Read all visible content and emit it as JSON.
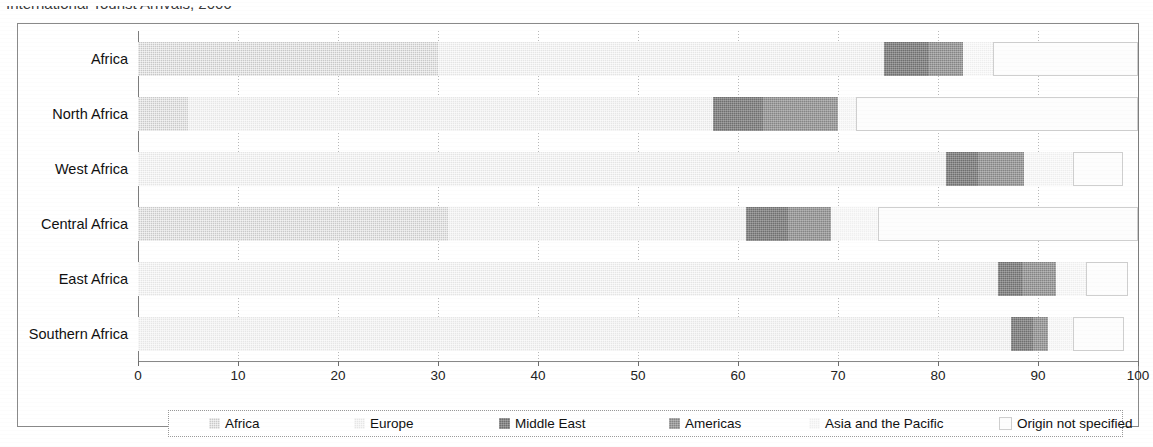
{
  "title": "International Tourist Arrivals, 2006",
  "title_right_mark": "",
  "axis": {
    "ticks": [
      0,
      10,
      20,
      30,
      40,
      50,
      60,
      70,
      80,
      90,
      100
    ],
    "min": 0,
    "max": 100
  },
  "legend": {
    "items": [
      {
        "label": "Africa",
        "swatch": "swatch-africa"
      },
      {
        "label": "Europe",
        "swatch": "swatch-europe"
      },
      {
        "label": "Middle East",
        "swatch": "swatch-middle-east"
      },
      {
        "label": "Americas",
        "swatch": "swatch-americas"
      },
      {
        "label": "Asia and the Pacific",
        "swatch": "swatch-asia-pacific"
      },
      {
        "label": "Origin not specified",
        "swatch": "swatch-origin-not-specified"
      }
    ]
  },
  "colors": {
    "africa": "#c9c9c9",
    "europe": "#e6e6e6",
    "middle_east": "#6f6f6f",
    "americas": "#858585",
    "asia_pacific": "#efefef",
    "origin_not_specified": "#fdfdfd",
    "frame": "#8a8a8a",
    "grid": "#b9b9b9"
  },
  "chart_data": {
    "type": "bar",
    "orientation": "horizontal",
    "stacked": true,
    "title": "International Tourist Arrivals, 2006",
    "xlabel": "",
    "ylabel": "",
    "xlim": [
      0,
      100
    ],
    "grid": true,
    "legend_position": "bottom",
    "categories": [
      "Africa",
      "North Africa",
      "West Africa",
      "Central Africa",
      "East Africa",
      "Southern Africa"
    ],
    "series": [
      {
        "name": "Africa",
        "values": [
          30.0,
          5.0,
          0.0,
          31.0,
          0.0,
          0.0
        ]
      },
      {
        "name": "Europe",
        "values": [
          44.6,
          52.5,
          80.8,
          29.8,
          86.0,
          87.3
        ]
      },
      {
        "name": "Middle East",
        "values": [
          4.5,
          5.0,
          3.2,
          4.2,
          2.5,
          2.2
        ]
      },
      {
        "name": "Americas",
        "values": [
          3.4,
          7.5,
          4.6,
          4.3,
          3.3,
          1.5
        ]
      },
      {
        "name": "Asia and the Pacific",
        "values": [
          3.0,
          1.8,
          4.9,
          4.7,
          3.0,
          2.5
        ]
      },
      {
        "name": "Origin not specified",
        "values": [
          14.5,
          28.2,
          5.0,
          26.0,
          4.2,
          5.1
        ]
      }
    ]
  },
  "bars": [
    {
      "category": "Africa",
      "segments": [
        {
          "series": "Africa",
          "start": 0.0,
          "end": 30.0,
          "style": "s-africa"
        },
        {
          "series": "Europe",
          "start": 30.0,
          "end": 74.6,
          "style": "s-europe"
        },
        {
          "series": "Middle East",
          "start": 74.6,
          "end": 79.1,
          "style": "s-me"
        },
        {
          "series": "Americas",
          "start": 79.1,
          "end": 82.5,
          "style": "s-americas"
        },
        {
          "series": "Asia and the Pacific",
          "start": 82.5,
          "end": 85.5,
          "style": "s-asia"
        },
        {
          "series": "Origin not specified",
          "start": 85.5,
          "end": 100.0,
          "style": "s-notspec"
        }
      ]
    },
    {
      "category": "North Africa",
      "segments": [
        {
          "series": "Africa",
          "start": 0.0,
          "end": 5.0,
          "style": "s-africa"
        },
        {
          "series": "Europe",
          "start": 5.0,
          "end": 57.5,
          "style": "s-europe"
        },
        {
          "series": "Middle East",
          "start": 57.5,
          "end": 62.5,
          "style": "s-me"
        },
        {
          "series": "Americas",
          "start": 62.5,
          "end": 70.0,
          "style": "s-americas"
        },
        {
          "series": "Asia and the Pacific",
          "start": 70.0,
          "end": 71.8,
          "style": "s-asia"
        },
        {
          "series": "Origin not specified",
          "start": 71.8,
          "end": 100.0,
          "style": "s-notspec"
        }
      ]
    },
    {
      "category": "West Africa",
      "segments": [
        {
          "series": "Europe",
          "start": 0.0,
          "end": 80.8,
          "style": "s-europe"
        },
        {
          "series": "Middle East",
          "start": 80.8,
          "end": 84.0,
          "style": "s-me"
        },
        {
          "series": "Americas",
          "start": 84.0,
          "end": 88.6,
          "style": "s-americas"
        },
        {
          "series": "Asia and the Pacific",
          "start": 88.6,
          "end": 93.5,
          "style": "s-asia"
        },
        {
          "series": "Origin not specified",
          "start": 93.5,
          "end": 98.5,
          "style": "s-notspec"
        }
      ]
    },
    {
      "category": "Central Africa",
      "segments": [
        {
          "series": "Africa",
          "start": 0.0,
          "end": 31.0,
          "style": "s-africa"
        },
        {
          "series": "Europe",
          "start": 31.0,
          "end": 60.8,
          "style": "s-europe"
        },
        {
          "series": "Middle East",
          "start": 60.8,
          "end": 65.0,
          "style": "s-me"
        },
        {
          "series": "Americas",
          "start": 65.0,
          "end": 69.3,
          "style": "s-americas"
        },
        {
          "series": "Asia and the Pacific",
          "start": 69.3,
          "end": 74.0,
          "style": "s-asia"
        },
        {
          "series": "Origin not specified",
          "start": 74.0,
          "end": 100.0,
          "style": "s-notspec"
        }
      ]
    },
    {
      "category": "East Africa",
      "segments": [
        {
          "series": "Europe",
          "start": 0.0,
          "end": 86.0,
          "style": "s-europe"
        },
        {
          "series": "Middle East",
          "start": 86.0,
          "end": 88.5,
          "style": "s-me"
        },
        {
          "series": "Americas",
          "start": 88.5,
          "end": 91.8,
          "style": "s-americas"
        },
        {
          "series": "Asia and the Pacific",
          "start": 91.8,
          "end": 94.8,
          "style": "s-asia"
        },
        {
          "series": "Origin not specified",
          "start": 94.8,
          "end": 99.0,
          "style": "s-notspec"
        }
      ]
    },
    {
      "category": "Southern Africa",
      "segments": [
        {
          "series": "Europe",
          "start": 0.0,
          "end": 87.3,
          "style": "s-europe"
        },
        {
          "series": "Middle East",
          "start": 87.3,
          "end": 89.5,
          "style": "s-me"
        },
        {
          "series": "Americas",
          "start": 89.5,
          "end": 91.0,
          "style": "s-americas"
        },
        {
          "series": "Asia and the Pacific",
          "start": 91.0,
          "end": 93.5,
          "style": "s-asia"
        },
        {
          "series": "Origin not specified",
          "start": 93.5,
          "end": 98.6,
          "style": "s-notspec"
        }
      ]
    }
  ]
}
